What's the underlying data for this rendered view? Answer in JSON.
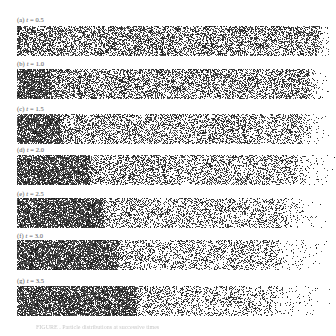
{
  "figure": {
    "panels": [
      {
        "id": "a",
        "label_prefix": "(a)",
        "label_var": "t",
        "label_value": "= 0.5",
        "label_top": 16,
        "strip_top": 26,
        "dense_front": 0,
        "bulk_end": 302,
        "tail_end": 318,
        "bulk_density": 0.5
      },
      {
        "id": "b",
        "label_prefix": "(b)",
        "label_var": "t",
        "label_value": "= 1.0",
        "label_top": 60,
        "strip_top": 69,
        "dense_front": 30,
        "bulk_end": 292,
        "tail_end": 318,
        "bulk_density": 0.48
      },
      {
        "id": "c",
        "label_prefix": "(c)",
        "label_var": "t",
        "label_value": "= 1.5",
        "label_top": 105,
        "strip_top": 114,
        "dense_front": 42,
        "bulk_end": 285,
        "tail_end": 320,
        "bulk_density": 0.42
      },
      {
        "id": "d",
        "label_prefix": "(d)",
        "label_var": "t",
        "label_value": "= 2.0",
        "label_top": 146,
        "strip_top": 155,
        "dense_front": 70,
        "bulk_end": 280,
        "tail_end": 322,
        "bulk_density": 0.4
      },
      {
        "id": "e",
        "label_prefix": "(e)",
        "label_var": "t",
        "label_value": "= 2.5",
        "label_top": 190,
        "strip_top": 198,
        "dense_front": 84,
        "bulk_end": 270,
        "tail_end": 322,
        "bulk_density": 0.36
      },
      {
        "id": "f",
        "label_prefix": "(f)",
        "label_var": "t",
        "label_value": "= 3.0",
        "label_top": 232,
        "strip_top": 240,
        "dense_front": 98,
        "bulk_end": 262,
        "tail_end": 324,
        "bulk_density": 0.34
      },
      {
        "id": "g",
        "label_prefix": "(g)",
        "label_var": "t",
        "label_value": "= 3.5",
        "label_top": 277,
        "strip_top": 286,
        "dense_front": 116,
        "bulk_end": 255,
        "tail_end": 326,
        "bulk_density": 0.32
      }
    ],
    "caption": "FIGURE . Particle distributions at successive times"
  },
  "colors": {
    "ink": "#1a1a1a",
    "label": "#555555",
    "background": "#ffffff"
  }
}
